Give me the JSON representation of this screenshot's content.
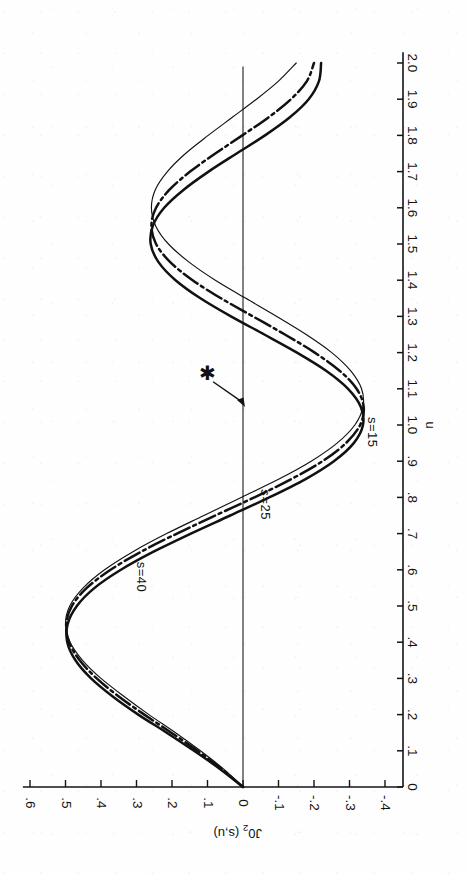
{
  "figure": {
    "orientation": "rotated-90-ccw",
    "background_color": "#fefefe",
    "ink_color": "#111111"
  },
  "axes": {
    "x_axis": {
      "label": "u",
      "min": 0,
      "max": 2.0,
      "tick_step": 0.1,
      "tick_labels": [
        "0",
        ".1",
        ".2",
        ".3",
        ".4",
        ".5",
        ".6",
        ".7",
        ".8",
        ".9",
        "1.0",
        "1.1",
        "1.2",
        "1.3",
        "1.4",
        "1.5",
        "1.6",
        "1.7",
        "1.8",
        "1.9",
        "2.0"
      ],
      "tick_values": [
        0,
        0.1,
        0.2,
        0.3,
        0.4,
        0.5,
        0.6,
        0.7,
        0.8,
        0.9,
        1.0,
        1.1,
        1.2,
        1.3,
        1.4,
        1.5,
        1.6,
        1.7,
        1.8,
        1.9,
        2.0
      ]
    },
    "y_axis": {
      "label_prefix": "J0",
      "label_subscript": "2",
      "label_suffix": " (s,u)",
      "label_full": "J0₂ (s,u)",
      "min": -0.4,
      "max": 0.6,
      "tick_step": 0.1,
      "tick_labels": [
        ".6",
        ".5",
        ".4",
        ".3",
        ".2",
        ".1",
        "0",
        "-.1",
        "-.2",
        "-.3",
        "-.4"
      ],
      "tick_values": [
        0.6,
        0.5,
        0.4,
        0.3,
        0.2,
        0.1,
        0,
        -0.1,
        -0.2,
        -0.3,
        -0.4
      ]
    }
  },
  "annotations": {
    "marker_symbol": "✱",
    "marker_name": "asterisk-marker",
    "arrow_name": "annotation-arrow"
  },
  "curve_labels": [
    {
      "text": "s=15",
      "name": "curve-label-s15"
    },
    {
      "text": "s=25",
      "name": "curve-label-s25"
    },
    {
      "text": "s=40",
      "name": "curve-label-s40"
    }
  ],
  "chart_data": {
    "type": "line",
    "title": "",
    "xlabel": "u",
    "ylabel": "J0₂ (s,u)",
    "xlim": [
      0,
      2.0
    ],
    "ylim": [
      -0.4,
      0.6
    ],
    "grid": false,
    "legend": "inline curve labels",
    "orientation": "plot rotated 90° counter-clockwise; u increases upward, J0₂ increases leftward",
    "annotations": [
      {
        "symbol": "✱",
        "points_to_u": 1.05,
        "points_to_value": 0.0,
        "label_u": 1.15,
        "label_value": 0.09
      }
    ],
    "series": [
      {
        "name": "s=15",
        "style": "thin-solid",
        "label_at_u": 0.98,
        "x": [
          0.0,
          0.05,
          0.1,
          0.15,
          0.2,
          0.25,
          0.3,
          0.35,
          0.4,
          0.45,
          0.5,
          0.55,
          0.6,
          0.65,
          0.7,
          0.75,
          0.8,
          0.85,
          0.9,
          0.95,
          1.0,
          1.05,
          1.1,
          1.15,
          1.2,
          1.25,
          1.3,
          1.35,
          1.4,
          1.45,
          1.5,
          1.55,
          1.6,
          1.65,
          1.7,
          1.75,
          1.8,
          1.85,
          1.9,
          1.95,
          2.0
        ],
        "y": [
          0.0,
          0.055,
          0.12,
          0.19,
          0.265,
          0.335,
          0.4,
          0.452,
          0.487,
          0.5,
          0.488,
          0.45,
          0.39,
          0.31,
          0.215,
          0.11,
          0.005,
          -0.1,
          -0.192,
          -0.265,
          -0.315,
          -0.338,
          -0.334,
          -0.303,
          -0.25,
          -0.178,
          -0.095,
          -0.008,
          0.078,
          0.152,
          0.21,
          0.246,
          0.258,
          0.247,
          0.213,
          0.162,
          0.098,
          0.03,
          -0.038,
          -0.1,
          -0.15
        ]
      },
      {
        "name": "s=25",
        "style": "dash-dot-thick",
        "label_at_u": 0.78,
        "x": [
          0.0,
          0.05,
          0.1,
          0.15,
          0.2,
          0.25,
          0.3,
          0.35,
          0.4,
          0.45,
          0.5,
          0.55,
          0.6,
          0.65,
          0.7,
          0.75,
          0.8,
          0.85,
          0.9,
          0.95,
          1.0,
          1.05,
          1.1,
          1.15,
          1.2,
          1.25,
          1.3,
          1.35,
          1.4,
          1.45,
          1.5,
          1.55,
          1.6,
          1.65,
          1.7,
          1.75,
          1.8,
          1.85,
          1.9,
          1.95,
          2.0
        ],
        "y": [
          0.0,
          0.06,
          0.128,
          0.202,
          0.278,
          0.35,
          0.412,
          0.46,
          0.49,
          0.498,
          0.482,
          0.44,
          0.373,
          0.287,
          0.186,
          0.078,
          -0.032,
          -0.135,
          -0.224,
          -0.29,
          -0.33,
          -0.34,
          -0.32,
          -0.272,
          -0.202,
          -0.118,
          -0.028,
          0.062,
          0.142,
          0.205,
          0.245,
          0.258,
          0.245,
          0.207,
          0.149,
          0.078,
          0.002,
          -0.072,
          -0.135,
          -0.18,
          -0.2
        ]
      },
      {
        "name": "s=40",
        "style": "thick-solid",
        "label_at_u": 0.58,
        "x": [
          0.0,
          0.05,
          0.1,
          0.15,
          0.2,
          0.25,
          0.3,
          0.35,
          0.4,
          0.45,
          0.5,
          0.55,
          0.6,
          0.65,
          0.7,
          0.75,
          0.8,
          0.85,
          0.9,
          0.95,
          1.0,
          1.05,
          1.1,
          1.15,
          1.2,
          1.25,
          1.3,
          1.35,
          1.4,
          1.45,
          1.5,
          1.55,
          1.6,
          1.65,
          1.7,
          1.75,
          1.8,
          1.85,
          1.9,
          1.95,
          2.0
        ],
        "y": [
          0.0,
          0.065,
          0.138,
          0.215,
          0.295,
          0.367,
          0.428,
          0.472,
          0.495,
          0.494,
          0.468,
          0.418,
          0.344,
          0.252,
          0.147,
          0.036,
          -0.074,
          -0.175,
          -0.256,
          -0.312,
          -0.338,
          -0.332,
          -0.296,
          -0.234,
          -0.152,
          -0.06,
          0.034,
          0.12,
          0.19,
          0.238,
          0.26,
          0.254,
          0.222,
          0.167,
          0.097,
          0.018,
          -0.062,
          -0.132,
          -0.185,
          -0.214,
          -0.22
        ]
      }
    ]
  }
}
